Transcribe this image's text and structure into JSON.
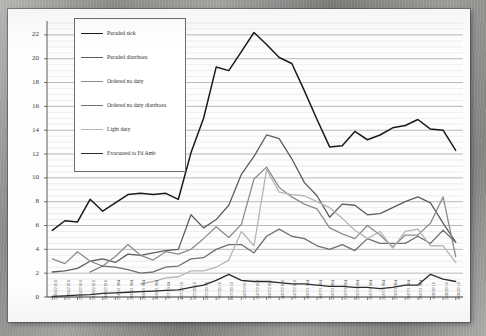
{
  "document": {
    "kind": "scanned-chart-page",
    "frame_color": "#8f8f8f",
    "page_color": "#fdfdfd"
  },
  "chart_data": {
    "type": "line",
    "title": "",
    "xlabel": "",
    "ylabel": "",
    "ylim": [
      0,
      23
    ],
    "yticks": [
      0,
      2,
      4,
      6,
      8,
      10,
      12,
      14,
      16,
      18,
      20,
      22
    ],
    "grid": "horizontal-minor-and-major",
    "legend_position": "upper-left-inset",
    "categories": [
      "20/06/2016",
      "21/06/2016",
      "22/06/2016",
      "23/06/2016",
      "24/06/2016",
      "27/06/1904",
      "28/06/1904",
      "29/06/1904",
      "30/06/1904",
      "1/07/1904",
      "4/07/2016",
      "5/07/2016",
      "6/07/2016",
      "7/07/2016",
      "8/07/2016",
      "11/07/2016",
      "12/07/2016",
      "13/07/2016",
      "14/07/2016",
      "15/07/2016",
      "18/07/1904",
      "19/07/1904",
      "20/07/1904",
      "21/07/1904",
      "22/07/1904",
      "25/07/1904",
      "26/07/1904",
      "27/07/1904",
      "28/07/1904",
      "29/07/1904",
      "1/08/2016",
      "2/08/2016",
      "3/08/2016"
    ],
    "xtick_labels": [
      "20/06/2 016",
      "21/06/2 016",
      "22/06/2 016",
      "23/06/2 016",
      "24/06/2 016",
      "27/06/1 904",
      "28/06/1 904",
      "29/06/1 904",
      "30/06/1 904",
      "1/07/19 04",
      "4/07/20 16",
      "5/07/20 16",
      "6/07/20 16",
      "7/07/20 16",
      "8/07/20 16",
      "11/07/2 016",
      "12/07/2 016",
      "13/07/2 016",
      "14/07/2 016",
      "15/07/2 016",
      "18/07/1 904",
      "19/07/1 904",
      "20/07/1 904",
      "21/07/1 904",
      "22/07/1 904",
      "25/07/1 904",
      "26/07/1 904",
      "27/07/1 904",
      "28/07/1 904",
      "29/07/1 904",
      "1/08/20 16",
      "2/08/20 16",
      "3/08/20 16"
    ],
    "series": [
      {
        "name": "Paraded sick",
        "color": "#1a1a1a",
        "width": 1.5,
        "values": [
          5.6,
          6.4,
          6.3,
          8.2,
          7.2,
          7.9,
          8.6,
          8.7,
          8.6,
          8.7,
          8.2,
          12.1,
          15.0,
          19.3,
          19.0,
          20.6,
          22.2,
          21.2,
          20.1,
          19.6,
          17.3,
          14.9,
          12.6,
          12.7,
          13.9,
          13.2,
          13.6,
          14.2,
          14.4,
          14.9,
          14.1,
          14.0,
          12.3
        ]
      },
      {
        "name": "Paraded diarrhoea",
        "color": "#5d5d5d",
        "width": 1.3,
        "values": [
          2.1,
          2.2,
          2.4,
          3.0,
          3.2,
          2.9,
          3.6,
          3.5,
          3.7,
          3.9,
          4.0,
          6.9,
          5.8,
          6.5,
          7.7,
          10.3,
          11.8,
          13.6,
          13.3,
          11.6,
          9.6,
          8.5,
          6.7,
          7.8,
          7.7,
          6.9,
          7.0,
          7.5,
          8.0,
          8.4,
          7.9,
          6.2,
          4.6
        ]
      },
      {
        "name": "Ordered no duty",
        "color": "#8c8c8c",
        "width": 1.3,
        "values": [
          3.2,
          2.8,
          3.8,
          3.0,
          2.6,
          3.4,
          4.4,
          3.5,
          3.1,
          3.8,
          3.6,
          4.0,
          4.9,
          5.9,
          5.0,
          6.1,
          9.9,
          10.9,
          9.2,
          8.4,
          7.8,
          7.4,
          5.8,
          5.3,
          4.9,
          6.0,
          5.2,
          4.2,
          5.2,
          5.2,
          6.2,
          8.4,
          3.4
        ]
      },
      {
        "name": "Ordered no duty diarrhoea",
        "color": "#707070",
        "width": 1.3,
        "values": [
          null,
          null,
          null,
          2.1,
          2.6,
          2.5,
          2.3,
          2.0,
          2.1,
          2.5,
          2.6,
          3.2,
          3.3,
          4.0,
          4.4,
          4.4,
          3.7,
          5.1,
          5.7,
          5.1,
          4.9,
          4.3,
          4.0,
          4.4,
          3.9,
          4.9,
          4.5,
          4.5,
          4.5,
          5.1,
          4.5,
          5.6,
          4.6
        ]
      },
      {
        "name": "Light duty",
        "color": "#b5b5b5",
        "width": 1.3,
        "values": [
          null,
          null,
          null,
          null,
          null,
          null,
          null,
          1.1,
          1.3,
          1.6,
          1.7,
          2.2,
          2.2,
          2.5,
          3.1,
          5.5,
          4.3,
          10.7,
          8.8,
          8.6,
          8.5,
          8.0,
          7.5,
          6.6,
          5.6,
          4.9,
          5.5,
          4.1,
          5.5,
          5.7,
          4.3,
          4.3,
          2.9
        ]
      },
      {
        "name": "Evacuated to Fd Amb",
        "color": "#2b2b2b",
        "width": 1.3,
        "values": [
          0.05,
          0.1,
          0.15,
          0.2,
          0.3,
          0.35,
          0.4,
          0.45,
          0.5,
          0.55,
          0.6,
          0.8,
          1.0,
          1.4,
          1.9,
          1.4,
          1.3,
          1.3,
          1.2,
          1.1,
          1.1,
          1.0,
          0.9,
          0.9,
          0.8,
          0.8,
          0.7,
          0.8,
          1.0,
          1.0,
          1.9,
          1.5,
          1.3
        ]
      }
    ]
  }
}
